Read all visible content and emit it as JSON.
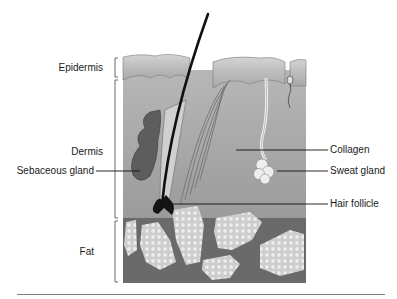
{
  "diagram": {
    "layers": [
      {
        "id": "epidermis",
        "label": "Epidermis"
      },
      {
        "id": "dermis",
        "label": "Dermis"
      },
      {
        "id": "fat",
        "label": "Fat"
      }
    ],
    "left_callouts": [
      {
        "id": "sebaceous-gland",
        "label": "Sebaceous gland"
      }
    ],
    "right_callouts": [
      {
        "id": "collagen",
        "label": "Collagen"
      },
      {
        "id": "sweat-gland",
        "label": "Sweat gland"
      },
      {
        "id": "hair-follicle",
        "label": "Hair follicle"
      }
    ],
    "colors": {
      "epidermis": "#bdbdbd",
      "dermis": "#a9a9a9",
      "fat_bg": "#6e6e6e",
      "fat_cells": "#e6e6e6",
      "gland": "#5a5a5a",
      "hair": "#111111"
    }
  }
}
